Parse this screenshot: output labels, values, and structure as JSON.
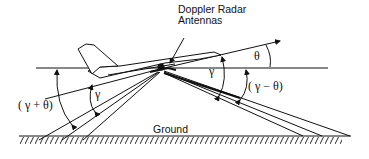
{
  "diagram": {
    "labels": {
      "antenna_line1": "Doppler Radar",
      "antenna_line2": "Antennas",
      "theta": "θ",
      "gamma_fore": "γ",
      "gamma_aft": "γ",
      "gamma_plus_theta": "( γ + θ)",
      "gamma_minus_theta": "( γ − θ)",
      "ground": "Ground"
    },
    "colors": {
      "line": "#111111",
      "background": "#ffffff"
    }
  }
}
